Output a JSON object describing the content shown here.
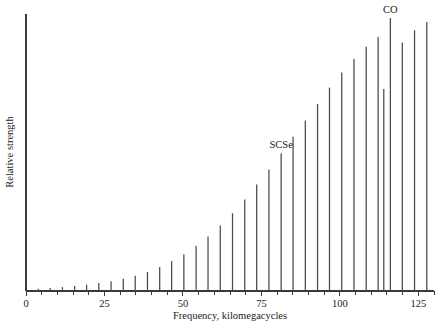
{
  "chart_data": {
    "type": "bar",
    "title": "",
    "xlabel": "Frequency, kilomegacycles",
    "ylabel": "Relative strength",
    "xlim": [
      0,
      130
    ],
    "ylim": [
      0,
      100
    ],
    "grid": false,
    "legend": null,
    "xticks": [
      0,
      25,
      50,
      75,
      100,
      125
    ],
    "xticklabels": [
      "0",
      "25",
      "50",
      "75",
      "100",
      "125"
    ],
    "minor_xtick_step": 5,
    "yticks": [],
    "yticklabels": [],
    "bar_style": "stick-spectrum",
    "x": [
      3.9,
      7.7,
      11.6,
      15.5,
      19.3,
      23.2,
      27.1,
      31.0,
      34.8,
      38.7,
      42.6,
      46.4,
      50.3,
      54.2,
      58.0,
      61.9,
      65.8,
      69.7,
      73.5,
      77.4,
      81.3,
      85.1,
      89.0,
      92.9,
      96.7,
      100.6,
      104.5,
      108.4,
      112.2,
      114.0,
      116.1,
      119.9,
      123.8,
      127.7
    ],
    "values": [
      0.8,
      1.1,
      1.4,
      1.8,
      2.3,
      2.9,
      3.6,
      4.5,
      5.6,
      7.0,
      8.8,
      11.0,
      13.5,
      16.5,
      20.0,
      24.0,
      28.5,
      33.5,
      39.0,
      44.5,
      50.5,
      56.5,
      62.5,
      68.5,
      74.5,
      80.0,
      85.0,
      89.5,
      93.0,
      74.0,
      100.0,
      91.0,
      95.5,
      98.5
    ],
    "annotations": [
      {
        "label": "SCSe",
        "x": 81.3,
        "y": 50.5,
        "note": "peak label above spike"
      },
      {
        "label": "CO",
        "x": 116.1,
        "y": 100.0,
        "note": "peak label above tallest spike"
      }
    ],
    "colors": {
      "axis": "#3a3a3a",
      "spike": "#4a4a4a",
      "text": "#1a1a1a",
      "background": "#ffffff"
    }
  },
  "figure": {
    "axis_title_x": "Frequency, kilomegacycles",
    "axis_title_y": "Relative strength"
  }
}
